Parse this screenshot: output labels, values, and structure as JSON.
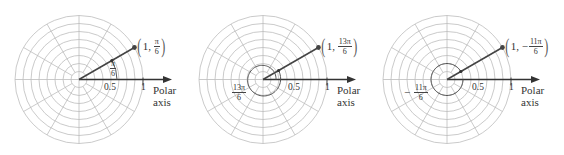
{
  "figure": {
    "grid": {
      "rings": 8,
      "ring_spacing_units": 0.125,
      "spokes_every_deg": 30,
      "grid_color": "#bdbdbd",
      "line_color": "#333333"
    },
    "panels": [
      {
        "id": "panel-1",
        "point_label": {
          "r": "1",
          "theta_num": "π",
          "theta_den": "6",
          "sign": ""
        },
        "angle_label": {
          "num": "π",
          "den": "6",
          "sign": ""
        },
        "angle_deg": 30,
        "angle_arc": "counterclockwise 30°",
        "ticks": [
          "0.5",
          "1"
        ],
        "axis_label": [
          "Polar",
          "axis"
        ]
      },
      {
        "id": "panel-2",
        "point_label": {
          "r": "1",
          "theta_num": "13π",
          "theta_den": "6",
          "sign": ""
        },
        "angle_label": {
          "num": "13π",
          "den": "6",
          "sign": ""
        },
        "angle_deg": 390,
        "angle_arc": "counterclockwise full turn plus 30°",
        "ticks": [
          "0.5",
          "1"
        ],
        "axis_label": [
          "Polar",
          "axis"
        ]
      },
      {
        "id": "panel-3",
        "point_label": {
          "r": "1",
          "theta_num": "11π",
          "theta_den": "6",
          "sign": "−"
        },
        "angle_label": {
          "num": "11π",
          "den": "6",
          "sign": "−"
        },
        "angle_deg": -330,
        "angle_arc": "clockwise 330°",
        "ticks": [
          "0.5",
          "1"
        ],
        "axis_label": [
          "Polar",
          "axis"
        ]
      }
    ]
  }
}
